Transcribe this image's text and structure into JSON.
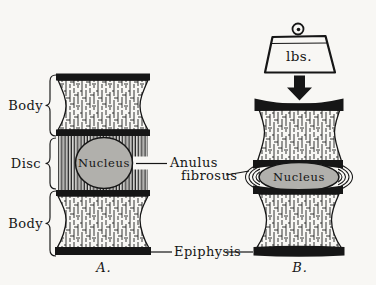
{
  "figure": {
    "caption_a": "A.",
    "caption_b": "B.",
    "labels": {
      "body_top": "Body",
      "disc": "Disc",
      "body_bottom": "Body",
      "nucleus_a": "Nucleus",
      "nucleus_b": "Nucleus",
      "anulus_line1": "Anulus",
      "anulus_line2": "fibrosus",
      "epiphysis": "Epiphysis",
      "weight": "lbs."
    },
    "colors": {
      "ink": "#161616",
      "nucleus_fill": "#b1b0ac",
      "background": "#f8f7f4"
    }
  }
}
